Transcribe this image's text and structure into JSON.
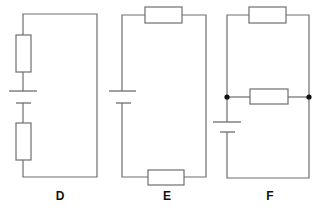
{
  "diagram": {
    "type": "circuit-diagrams",
    "colors": {
      "wire": "#6e6e6e",
      "junction": "#111111",
      "label": "#111111",
      "background": "#ffffff"
    },
    "circuits": [
      {
        "label": "D",
        "description": "Series circuit: cell with one resistor above and one resistor below on the left branch",
        "components": [
          "resistor",
          "cell",
          "resistor"
        ]
      },
      {
        "label": "E",
        "description": "Series circuit: cell on left branch, resistor on top wire, resistor on bottom wire",
        "components": [
          "resistor",
          "cell",
          "resistor"
        ]
      },
      {
        "label": "F",
        "description": "Parallel circuit: two resistors in parallel between junction nodes, cell on left branch",
        "components": [
          "resistor",
          "resistor",
          "cell"
        ],
        "junctions": 2
      }
    ]
  }
}
